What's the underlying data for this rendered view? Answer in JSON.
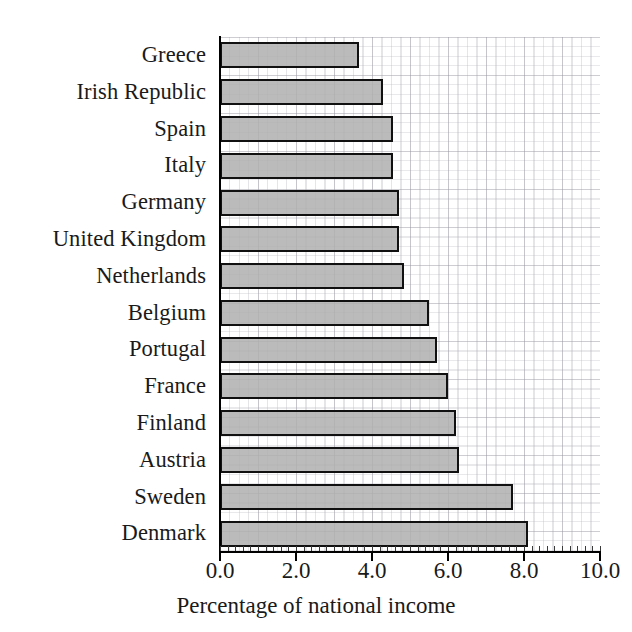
{
  "chart_data": {
    "type": "bar",
    "orientation": "horizontal",
    "title": "",
    "xlabel": "Percentage of national income",
    "ylabel": "",
    "xlim": [
      0.0,
      10.0
    ],
    "xticks": [
      "0.0",
      "2.0",
      "4.0",
      "6.0",
      "8.0",
      "10.0"
    ],
    "xtick_values": [
      0.0,
      2.0,
      4.0,
      6.0,
      8.0,
      10.0
    ],
    "grid": true,
    "legend": "none",
    "categories": [
      "Greece",
      "Irish Republic",
      "Spain",
      "Italy",
      "Germany",
      "United Kingdom",
      "Netherlands",
      "Belgium",
      "Portugal",
      "France",
      "Finland",
      "Austria",
      "Sweden",
      "Denmark"
    ],
    "values": [
      3.65,
      4.3,
      4.55,
      4.55,
      4.7,
      4.7,
      4.85,
      5.5,
      5.7,
      6.0,
      6.2,
      6.3,
      7.7,
      8.1
    ],
    "bar_fill_color": "#b0b0b0",
    "bar_edge_color": "#111111",
    "background_color": "#ffffff",
    "grid_color": "#aaaab4"
  }
}
